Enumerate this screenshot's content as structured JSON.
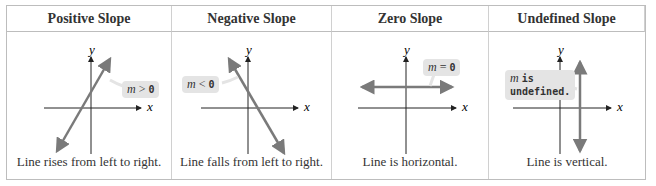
{
  "columns": [
    {
      "header": "Positive Slope",
      "slope_label_var": "m",
      "slope_label_rel": ">",
      "slope_label_val": "0",
      "caption": "Line rises from left to right.",
      "axis_x": "x",
      "axis_y": "y"
    },
    {
      "header": "Negative Slope",
      "slope_label_var": "m",
      "slope_label_rel": "<",
      "slope_label_val": "0",
      "caption": "Line falls from left to right.",
      "axis_x": "x",
      "axis_y": "y"
    },
    {
      "header": "Zero Slope",
      "slope_label_var": "m",
      "slope_label_rel": "=",
      "slope_label_val": "0",
      "caption": "Line is horizontal.",
      "axis_x": "x",
      "axis_y": "y"
    },
    {
      "header": "Undefined Slope",
      "slope_label_var": "m",
      "slope_label_rel": "is",
      "slope_label_val": "undefined.",
      "caption": "Line is vertical.",
      "axis_x": "x",
      "axis_y": "y"
    }
  ],
  "colors": {
    "line": "#7a7a7a",
    "axis": "#222222",
    "bubble": "#e4e4e4",
    "border": "#bdbdbd"
  }
}
